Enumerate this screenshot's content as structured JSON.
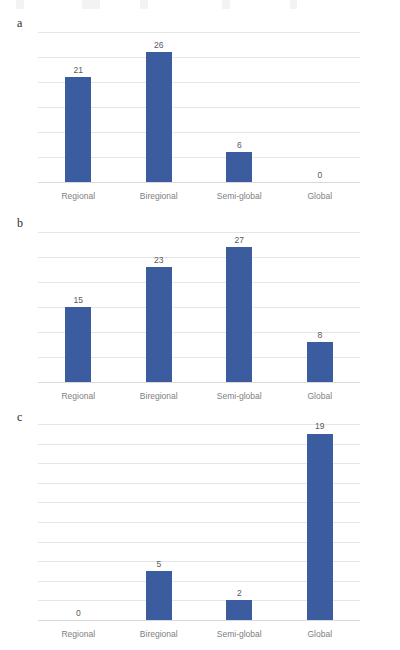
{
  "figure": {
    "categories": [
      "Regional",
      "Biregional",
      "Semi-global",
      "Global"
    ],
    "bar_color": "#3B5C9E",
    "gridline_color": "#E6E6E6",
    "tick_label_color": "#808080",
    "value_label_color": "#595959"
  },
  "chart_data": [
    {
      "type": "bar",
      "panel_label": "a",
      "title": "",
      "xlabel": "",
      "ylabel": "",
      "categories": [
        "Regional",
        "Biregional",
        "Semi-global",
        "Global"
      ],
      "values": [
        21,
        26,
        6,
        0
      ],
      "value_labels": [
        "21",
        "26",
        "6",
        "0"
      ],
      "yticks": [
        0,
        5,
        10,
        15,
        20,
        25,
        30
      ],
      "ytick_labels": [
        "0",
        "5",
        "10",
        "15",
        "20",
        "25",
        "30"
      ],
      "ylim": [
        0,
        30
      ],
      "grid": true,
      "legend": "none"
    },
    {
      "type": "bar",
      "panel_label": "b",
      "title": "",
      "xlabel": "",
      "ylabel": "",
      "categories": [
        "Regional",
        "Biregional",
        "Semi-global",
        "Global"
      ],
      "values": [
        15,
        23,
        27,
        8
      ],
      "value_labels": [
        "15",
        "23",
        "27",
        "8"
      ],
      "yticks": [
        0,
        5,
        10,
        15,
        20,
        25,
        30
      ],
      "ytick_labels": [
        "0",
        "5",
        "10",
        "15",
        "20",
        "25",
        "30"
      ],
      "ylim": [
        0,
        30
      ],
      "grid": true,
      "legend": "none"
    },
    {
      "type": "bar",
      "panel_label": "c",
      "title": "",
      "xlabel": "",
      "ylabel": "",
      "categories": [
        "Regional",
        "Biregional",
        "Semi-global",
        "Global"
      ],
      "values": [
        0,
        5,
        2,
        19
      ],
      "value_labels": [
        "0",
        "5",
        "2",
        "19"
      ],
      "yticks": [
        0,
        2,
        4,
        6,
        8,
        10,
        12,
        14,
        16,
        18,
        20
      ],
      "ytick_labels": [
        "0",
        "2",
        "4",
        "6",
        "8",
        "10",
        "12",
        "14",
        "16",
        "18",
        "20"
      ],
      "ylim": [
        0,
        20
      ],
      "grid": true,
      "legend": "none"
    }
  ]
}
